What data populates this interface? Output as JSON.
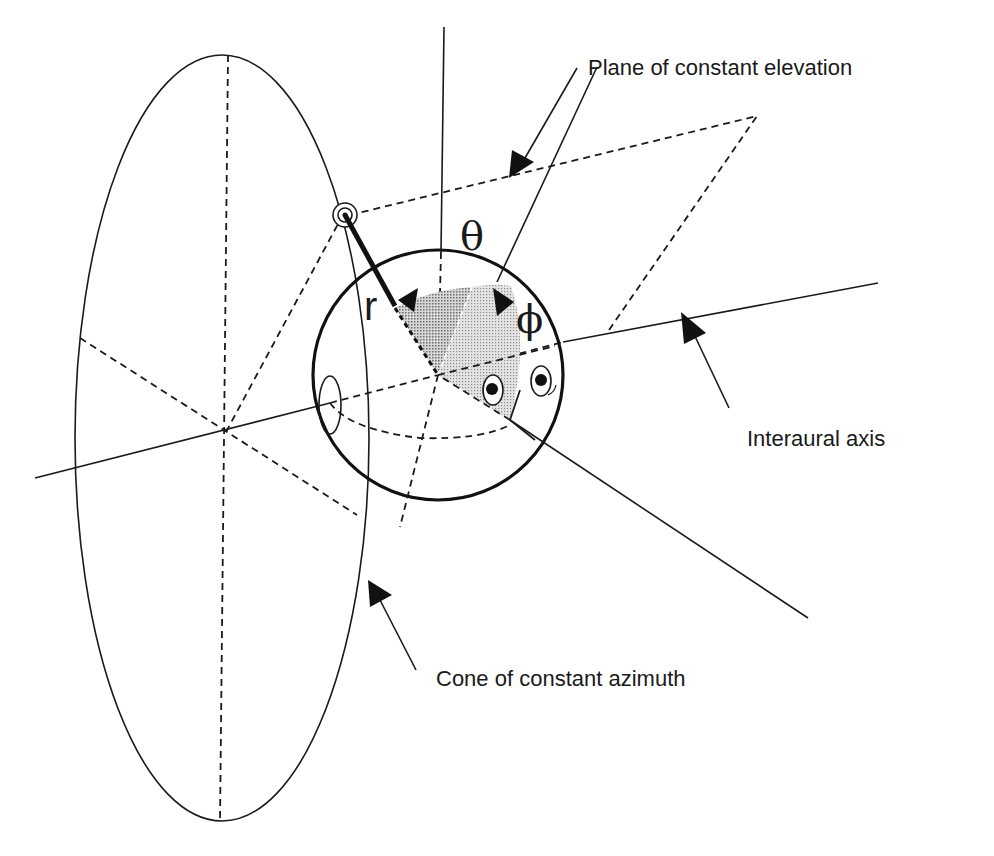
{
  "figure": {
    "labels": {
      "plane": "Plane of constant elevation",
      "interaural": "Interaural axis",
      "cone": "Cone of constant azimuth",
      "theta": "θ",
      "phi": "ϕ",
      "r": "r"
    },
    "colors": {
      "ink": "#1a1a1a",
      "shade": "#9a9a9a",
      "background": "#ffffff"
    },
    "icons": {
      "source": "sound-source-icon",
      "head": "head-sphere-icon"
    }
  }
}
